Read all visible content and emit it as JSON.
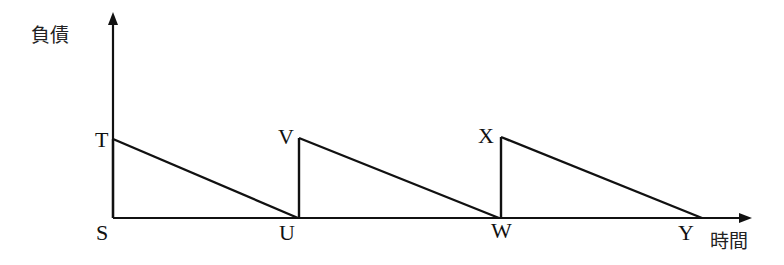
{
  "diagram": {
    "type": "sawtooth-debt-over-time",
    "axes": {
      "y_label": "負債",
      "x_label": "時間"
    },
    "points": {
      "S": "S",
      "T": "T",
      "U": "U",
      "V": "V",
      "W": "W",
      "X": "X",
      "Y": "Y"
    },
    "segments": [
      {
        "from": "T",
        "to": "U",
        "kind": "declining"
      },
      {
        "from": "U",
        "to": "V",
        "kind": "vertical-jump"
      },
      {
        "from": "V",
        "to": "W",
        "kind": "declining"
      },
      {
        "from": "W",
        "to": "X",
        "kind": "vertical-jump"
      },
      {
        "from": "X",
        "to": "Y",
        "kind": "declining"
      }
    ],
    "colors": {
      "line": "#111111",
      "background": "#ffffff"
    }
  }
}
